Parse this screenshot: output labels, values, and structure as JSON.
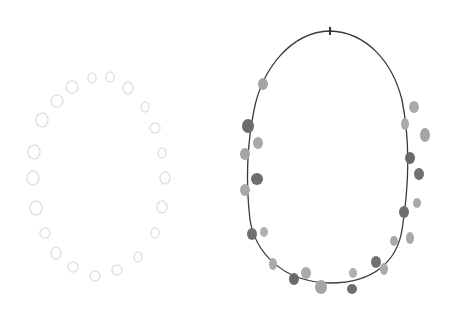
{
  "figure": {
    "left_ring": {
      "style": "faint dotted ring",
      "color": "#e6e6e6"
    },
    "right_ring": {
      "style": "outlined egg with gray dots",
      "outline_color": "#333333",
      "dot_colors": [
        "#9a9a9a",
        "#6e6e6e",
        "#b0b0b0"
      ]
    }
  }
}
